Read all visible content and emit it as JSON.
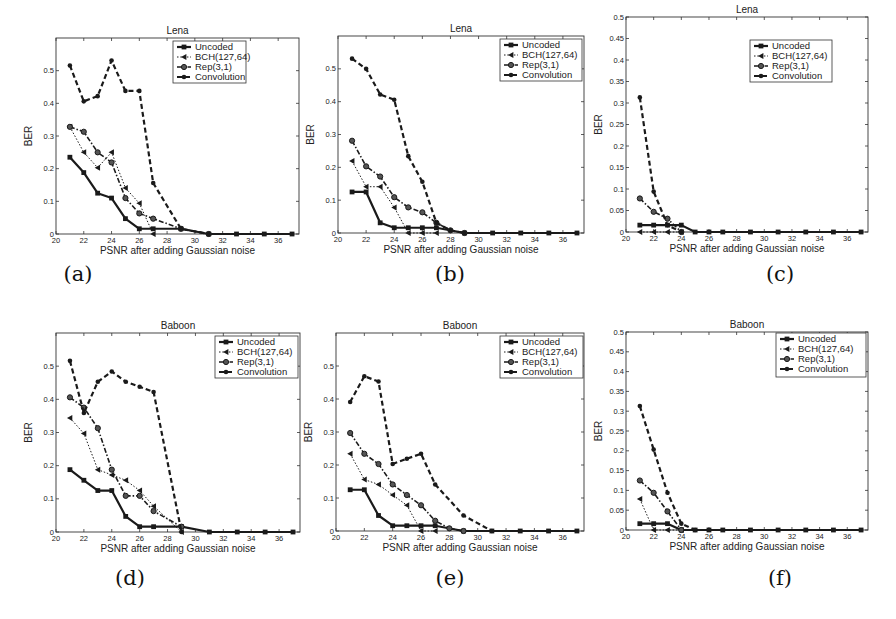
{
  "figure": {
    "series_styles": {
      "Uncoded": {
        "dash": "",
        "width": 2.2,
        "marker": "square"
      },
      "BCH(127,64)": {
        "dash": "1.5,1.8",
        "width": 1.0,
        "marker": "triangle-left"
      },
      "Rep(3,1)": {
        "dash": "5,2,1.5,2",
        "width": 1.6,
        "marker": "circle"
      },
      "Convolution": {
        "dash": "5,3",
        "width": 2.2,
        "marker": "dot"
      }
    },
    "color": "#1a1a1a"
  },
  "panels": [
    {
      "id": "a",
      "caption": "(a)",
      "title": "Lena",
      "xlabel": "PSNR after adding Gaussian noise",
      "ylabel": "BER",
      "frame": {
        "x": 56,
        "y": 38,
        "w": 243,
        "h": 196
      },
      "captionPos": {
        "x": 48,
        "y": 262
      },
      "legend": {
        "x": 173,
        "y": 41,
        "w": 73,
        "h": 42
      }
    },
    {
      "id": "b",
      "caption": "(b)",
      "title": "Lena",
      "xlabel": "PSNR after adding Gaussian noise",
      "ylabel": "BER",
      "frame": {
        "x": 338,
        "y": 36,
        "w": 246,
        "h": 197
      },
      "captionPos": {
        "x": 420,
        "y": 262
      },
      "legend": {
        "x": 500,
        "y": 39,
        "w": 82,
        "h": 42
      }
    },
    {
      "id": "c",
      "caption": "(c)",
      "title": "Lena",
      "xlabel": "PSNR after adding Gaussian noise",
      "ylabel": "BER",
      "frame": {
        "x": 626,
        "y": 17,
        "w": 242,
        "h": 215
      },
      "captionPos": {
        "x": 750,
        "y": 262
      },
      "legend": {
        "x": 750,
        "y": 40,
        "w": 82,
        "h": 42
      }
    },
    {
      "id": "d",
      "caption": "(d)",
      "title": "Baboon",
      "xlabel": "PSNR after adding Gaussian noise",
      "ylabel": "BER",
      "frame": {
        "x": 56,
        "y": 333,
        "w": 244,
        "h": 199
      },
      "captionPos": {
        "x": 100,
        "y": 566
      },
      "legend": {
        "x": 215,
        "y": 336,
        "w": 83,
        "h": 42
      }
    },
    {
      "id": "e",
      "caption": "(e)",
      "title": "Baboon",
      "xlabel": "PSNR after adding Gaussian noise",
      "ylabel": "BER",
      "frame": {
        "x": 336,
        "y": 333,
        "w": 248,
        "h": 198
      },
      "captionPos": {
        "x": 420,
        "y": 566
      },
      "legend": {
        "x": 500,
        "y": 336,
        "w": 83,
        "h": 42
      }
    },
    {
      "id": "f",
      "caption": "(f)",
      "title": "Baboon",
      "xlabel": "PSNR after adding Gaussian noise",
      "ylabel": "BER",
      "frame": {
        "x": 626,
        "y": 332,
        "w": 242,
        "h": 198
      },
      "captionPos": {
        "x": 750,
        "y": 566
      },
      "legend": {
        "x": 776,
        "y": 333,
        "w": 90,
        "h": 44
      }
    }
  ],
  "chart_data": [
    {
      "panel": "(a)",
      "type": "line",
      "title": "Lena",
      "xlabel": "PSNR after adding Gaussian noise",
      "ylabel": "BER",
      "xlim": [
        20,
        37.5
      ],
      "ylim": [
        0,
        0.6
      ],
      "xticks": [
        20,
        22,
        24,
        26,
        28,
        30,
        32,
        34,
        36
      ],
      "yticks": [
        0,
        0.1,
        0.2,
        0.3,
        0.4,
        0.5
      ],
      "ytick_labels": [
        "0",
        "0.1",
        "0.2",
        "0.3",
        "0.4",
        "0.5"
      ],
      "legend": [
        "Uncoded",
        "BCH(127,64)",
        "Rep(3,1)",
        "Convolution"
      ],
      "legend_position": "upper right",
      "grid": false,
      "series": [
        {
          "name": "Uncoded",
          "x": [
            21,
            22,
            23,
            24,
            25,
            26,
            27,
            29,
            31,
            33,
            35,
            37
          ],
          "values": [
            0.235,
            0.188,
            0.125,
            0.11,
            0.047,
            0.016,
            0.016,
            0.016,
            0,
            0,
            0,
            0
          ]
        },
        {
          "name": "BCH(127,64)",
          "x": [
            21,
            22,
            23,
            24,
            25,
            26,
            27
          ],
          "values": [
            0.328,
            0.25,
            0.203,
            0.25,
            0.141,
            0.094,
            0
          ]
        },
        {
          "name": "Rep(3,1)",
          "x": [
            21,
            22,
            23,
            24,
            25,
            26,
            27,
            29,
            31
          ],
          "values": [
            0.328,
            0.313,
            0.25,
            0.219,
            0.11,
            0.063,
            0.047,
            0.016,
            0
          ]
        },
        {
          "name": "Convolution",
          "x": [
            21,
            22,
            23,
            24,
            25,
            26,
            27,
            29,
            31
          ],
          "values": [
            0.516,
            0.406,
            0.422,
            0.531,
            0.438,
            0.438,
            0.156,
            0.016,
            0
          ]
        }
      ]
    },
    {
      "panel": "(b)",
      "type": "line",
      "title": "Lena",
      "xlabel": "PSNR after adding Gaussian noise",
      "ylabel": "BER",
      "xlim": [
        20,
        37.5
      ],
      "ylim": [
        0,
        0.6
      ],
      "xticks": [
        20,
        22,
        24,
        26,
        28,
        30,
        32,
        34,
        36
      ],
      "yticks": [
        0,
        0.1,
        0.2,
        0.3,
        0.4,
        0.5
      ],
      "ytick_labels": [
        "0",
        "0.1",
        "0.2",
        "0.3",
        "0.4",
        "0.5"
      ],
      "legend": [
        "Uncoded",
        "BCH(127,64)",
        "Rep(3,1)",
        "Convolution"
      ],
      "legend_position": "upper right",
      "grid": false,
      "series": [
        {
          "name": "Uncoded",
          "x": [
            21,
            22,
            23,
            24,
            25,
            26,
            27,
            29,
            31,
            33,
            35,
            37
          ],
          "values": [
            0.125,
            0.125,
            0.031,
            0.016,
            0.016,
            0.016,
            0.016,
            0,
            0,
            0,
            0,
            0
          ]
        },
        {
          "name": "BCH(127,64)",
          "x": [
            21,
            22,
            23,
            24,
            25,
            26,
            27
          ],
          "values": [
            0.219,
            0.141,
            0.141,
            0.078,
            0,
            0,
            0
          ]
        },
        {
          "name": "Rep(3,1)",
          "x": [
            21,
            22,
            23,
            24,
            25,
            26,
            27,
            28,
            29
          ],
          "values": [
            0.281,
            0.203,
            0.172,
            0.109,
            0.078,
            0.063,
            0.031,
            0.008,
            0
          ]
        },
        {
          "name": "Convolution",
          "x": [
            21,
            22,
            23,
            24,
            25,
            26,
            27,
            28,
            29
          ],
          "values": [
            0.531,
            0.5,
            0.422,
            0.406,
            0.234,
            0.156,
            0.031,
            0.008,
            0
          ]
        }
      ]
    },
    {
      "panel": "(c)",
      "type": "line",
      "title": "Lena",
      "xlabel": "PSNR after adding Gaussian noise",
      "ylabel": "BER",
      "xlim": [
        20,
        37.5
      ],
      "ylim": [
        0,
        0.5
      ],
      "xticks": [
        20,
        22,
        24,
        26,
        28,
        30,
        32,
        34,
        36
      ],
      "yticks": [
        0,
        0.05,
        0.1,
        0.15,
        0.2,
        0.25,
        0.3,
        0.35,
        0.4,
        0.45,
        0.5
      ],
      "ytick_labels": [
        "0",
        "0.05",
        "0.1",
        "0.15",
        "0.2",
        "0.25",
        "0.3",
        "0.35",
        "0.4",
        "0.45",
        "0.5"
      ],
      "legend": [
        "Uncoded",
        "BCH(127,64)",
        "Rep(3,1)",
        "Convolution"
      ],
      "legend_position": "upper right",
      "grid": false,
      "series": [
        {
          "name": "Uncoded",
          "x": [
            21,
            22,
            23,
            24,
            25,
            26,
            27,
            29,
            31,
            33,
            35,
            37
          ],
          "values": [
            0.016,
            0.016,
            0.016,
            0.016,
            0,
            0,
            0,
            0,
            0,
            0,
            0,
            0
          ]
        },
        {
          "name": "BCH(127,64)",
          "x": [
            21,
            22,
            23,
            24
          ],
          "values": [
            0,
            0,
            0,
            0
          ]
        },
        {
          "name": "Rep(3,1)",
          "x": [
            21,
            22,
            23,
            24
          ],
          "values": [
            0.078,
            0.047,
            0.031,
            0
          ]
        },
        {
          "name": "Convolution",
          "x": [
            21,
            22,
            23,
            24
          ],
          "values": [
            0.313,
            0.094,
            0.016,
            0
          ]
        }
      ]
    },
    {
      "panel": "(d)",
      "type": "line",
      "title": "Baboon",
      "xlabel": "PSNR after adding Gaussian noise",
      "ylabel": "BER",
      "xlim": [
        20,
        37.5
      ],
      "ylim": [
        0,
        0.6
      ],
      "xticks": [
        20,
        22,
        24,
        26,
        28,
        30,
        32,
        34,
        36
      ],
      "yticks": [
        0,
        0.1,
        0.2,
        0.3,
        0.4,
        0.5
      ],
      "ytick_labels": [
        "0",
        "0.1",
        "0.2",
        "0.3",
        "0.4",
        "0.5"
      ],
      "legend": [
        "Uncoded",
        "BCH(127,64)",
        "Rep(3,1)",
        "Convolution"
      ],
      "legend_position": "upper right",
      "grid": false,
      "series": [
        {
          "name": "Uncoded",
          "x": [
            21,
            22,
            23,
            24,
            25,
            26,
            27,
            29,
            31,
            33,
            35,
            37
          ],
          "values": [
            0.188,
            0.156,
            0.125,
            0.125,
            0.047,
            0.016,
            0.016,
            0.016,
            0,
            0,
            0,
            0
          ]
        },
        {
          "name": "BCH(127,64)",
          "x": [
            21,
            22,
            23,
            24,
            25,
            26,
            27,
            29
          ],
          "values": [
            0.344,
            0.297,
            0.188,
            0.172,
            0.156,
            0.125,
            0.078,
            0
          ]
        },
        {
          "name": "Rep(3,1)",
          "x": [
            21,
            22,
            23,
            24,
            25,
            26,
            27,
            29
          ],
          "values": [
            0.406,
            0.375,
            0.313,
            0.188,
            0.109,
            0.109,
            0.063,
            0.016
          ]
        },
        {
          "name": "Convolution",
          "x": [
            21,
            22,
            23,
            24,
            25,
            26,
            27,
            29
          ],
          "values": [
            0.516,
            0.359,
            0.453,
            0.484,
            0.453,
            0.438,
            0.422,
            0
          ]
        }
      ]
    },
    {
      "panel": "(e)",
      "type": "line",
      "title": "Baboon",
      "xlabel": "PSNR after adding Gaussian noise",
      "ylabel": "BER",
      "xlim": [
        20,
        37.5
      ],
      "ylim": [
        0,
        0.6
      ],
      "xticks": [
        20,
        22,
        24,
        26,
        28,
        30,
        32,
        34,
        36
      ],
      "yticks": [
        0,
        0.1,
        0.2,
        0.3,
        0.4,
        0.5
      ],
      "ytick_labels": [
        "0",
        "0.1",
        "0.2",
        "0.3",
        "0.4",
        "0.5"
      ],
      "legend": [
        "Uncoded",
        "BCH(127,64)",
        "Rep(3,1)",
        "Convolution"
      ],
      "legend_position": "upper right",
      "grid": false,
      "series": [
        {
          "name": "Uncoded",
          "x": [
            21,
            22,
            23,
            24,
            25,
            26,
            27,
            29,
            31,
            33,
            35,
            37
          ],
          "values": [
            0.125,
            0.125,
            0.047,
            0.016,
            0.016,
            0.016,
            0.016,
            0,
            0,
            0,
            0,
            0
          ]
        },
        {
          "name": "BCH(127,64)",
          "x": [
            21,
            22,
            23,
            24,
            25,
            26,
            27
          ],
          "values": [
            0.234,
            0.156,
            0.141,
            0.109,
            0.078,
            0,
            0
          ]
        },
        {
          "name": "Rep(3,1)",
          "x": [
            21,
            22,
            23,
            24,
            25,
            26,
            27,
            28,
            29
          ],
          "values": [
            0.297,
            0.234,
            0.203,
            0.141,
            0.109,
            0.078,
            0.031,
            0.008,
            0
          ]
        },
        {
          "name": "Convolution",
          "x": [
            21,
            22,
            23,
            24,
            25,
            26,
            27,
            29,
            31
          ],
          "values": [
            0.391,
            0.469,
            0.453,
            0.203,
            0.219,
            0.234,
            0.141,
            0.047,
            0
          ]
        }
      ]
    },
    {
      "panel": "(f)",
      "type": "line",
      "title": "Baboon",
      "xlabel": "PSNR after adding Gaussian noise",
      "ylabel": "BER",
      "xlim": [
        20,
        37.5
      ],
      "ylim": [
        0,
        0.5
      ],
      "xticks": [
        20,
        22,
        24,
        26,
        28,
        30,
        32,
        34,
        36
      ],
      "yticks": [
        0,
        0.05,
        0.1,
        0.15,
        0.2,
        0.25,
        0.3,
        0.35,
        0.4,
        0.45,
        0.5
      ],
      "ytick_labels": [
        "0",
        "0.05",
        "0.1",
        "0.15",
        "0.2",
        "0.25",
        "0.3",
        "0.35",
        "0.4",
        "0.45",
        "0.5"
      ],
      "legend": [
        "Uncoded",
        "BCH(127,64)",
        "Rep(3,1)",
        "Convolution"
      ],
      "legend_position": "upper right",
      "grid": false,
      "series": [
        {
          "name": "Uncoded",
          "x": [
            21,
            22,
            23,
            24,
            25,
            26,
            27,
            29,
            31,
            33,
            35,
            37
          ],
          "values": [
            0.016,
            0.016,
            0.016,
            0,
            0,
            0,
            0,
            0,
            0,
            0,
            0,
            0
          ]
        },
        {
          "name": "BCH(127,64)",
          "x": [
            21,
            22,
            23,
            24
          ],
          "values": [
            0.078,
            0,
            0,
            0
          ]
        },
        {
          "name": "Rep(3,1)",
          "x": [
            21,
            22,
            23,
            24
          ],
          "values": [
            0.125,
            0.094,
            0.047,
            0
          ]
        },
        {
          "name": "Convolution",
          "x": [
            21,
            22,
            23,
            24,
            25
          ],
          "values": [
            0.313,
            0.203,
            0.094,
            0.016,
            0
          ]
        }
      ]
    }
  ]
}
